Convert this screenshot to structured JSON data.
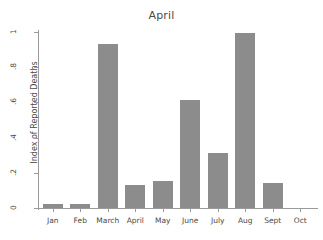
{
  "chart_data": {
    "type": "bar",
    "title": "April",
    "xlabel": "",
    "ylabel": "Index of Reported Deaths",
    "categories": [
      "Jan",
      "Feb",
      "March",
      "April",
      "May",
      "June",
      "July",
      "Aug",
      "Sept",
      "Oct"
    ],
    "values": [
      0.02,
      0.02,
      0.93,
      0.13,
      0.155,
      0.615,
      0.31,
      0.995,
      0.14,
      0
    ],
    "ylim": [
      0,
      1
    ],
    "ytick_values": [
      0,
      0.2,
      0.4,
      0.6,
      0.8,
      1
    ],
    "ytick_labels": [
      "0",
      ".2",
      ".4",
      ".6",
      ".8",
      "1"
    ],
    "grid": false,
    "legend": false,
    "bar_color": "#8c8c8c",
    "axis_color": "#9a9a9a",
    "text_color": "#4a4a4a",
    "background_color": "#ffffff"
  }
}
